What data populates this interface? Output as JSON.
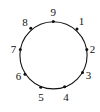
{
  "diagram": {
    "type": "circle-with-labeled-points",
    "circle": {
      "cx": 53.5,
      "cy": 55.3,
      "r": 33.6,
      "stroke": "#111111",
      "stroke_width": 1.1
    },
    "dot_color": "#111111",
    "dot_radius": 1.5,
    "points": [
      {
        "label": "9",
        "x": 53.3,
        "y": 21.5,
        "lx": 53.3,
        "ly": 15.5
      },
      {
        "label": "1",
        "x": 77.0,
        "y": 29.0,
        "lx": 81.5,
        "ly": 24.5
      },
      {
        "label": "2",
        "x": 86.8,
        "y": 49.5,
        "lx": 92.5,
        "ly": 53.0
      },
      {
        "label": "3",
        "x": 82.5,
        "y": 72.5,
        "lx": 88.5,
        "ly": 78.5
      },
      {
        "label": "4",
        "x": 64.6,
        "y": 86.8,
        "lx": 66.0,
        "ly": 101.0
      },
      {
        "label": "5",
        "x": 40.8,
        "y": 87.2,
        "lx": 41.0,
        "ly": 101.0
      },
      {
        "label": "6",
        "x": 25.0,
        "y": 74.2,
        "lx": 18.5,
        "ly": 79.5
      },
      {
        "label": "7",
        "x": 20.3,
        "y": 49.5,
        "lx": 13.5,
        "ly": 52.5
      },
      {
        "label": "8",
        "x": 30.8,
        "y": 28.3,
        "lx": 25.0,
        "ly": 25.5
      }
    ]
  }
}
